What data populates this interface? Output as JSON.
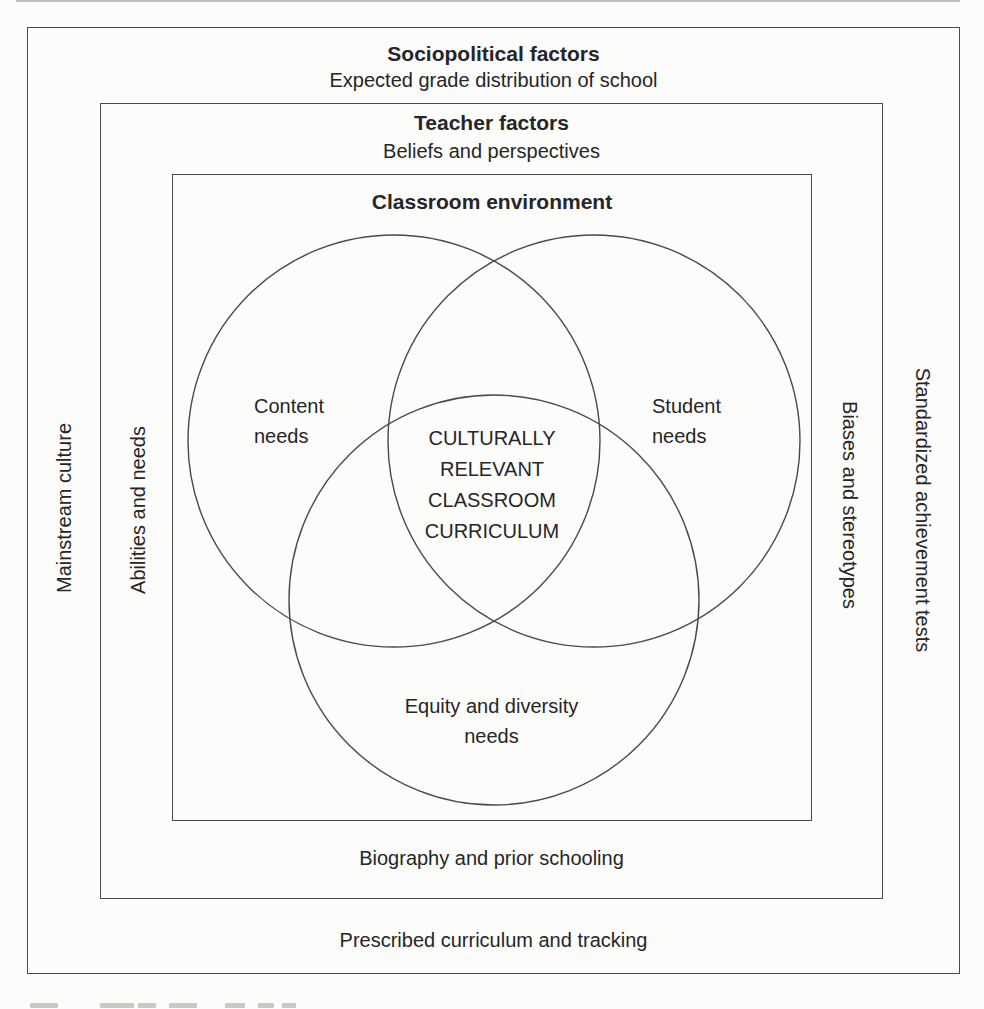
{
  "figure": {
    "layers": {
      "sociopolitical": {
        "title": "Sociopolitical factors",
        "subtitle": "Expected grade distribution of school",
        "left_label": "Mainstream culture",
        "right_label": "Standardized achievement tests",
        "bottom_label": "Prescribed curriculum and tracking"
      },
      "teacher": {
        "title": "Teacher factors",
        "subtitle": "Beliefs and perspectives",
        "left_label": "Abilities and needs",
        "right_label": "Biases and stereotypes",
        "bottom_label": "Biography and prior schooling"
      },
      "classroom": {
        "title": "Classroom environment"
      }
    },
    "venn": {
      "left_circle_label": "Content needs",
      "right_circle_label": "Student needs",
      "bottom_circle_label": "Equity and diversity needs",
      "center_lines": [
        "CULTURALLY",
        "RELEVANT",
        "CLASSROOM",
        "CURRICULUM"
      ]
    },
    "colors": {
      "line": "#4a4a4a",
      "text": "#262626",
      "background": "#fcfcfb"
    }
  }
}
